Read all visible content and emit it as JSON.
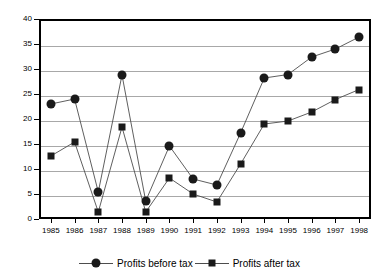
{
  "chart_data": {
    "type": "line",
    "title": "",
    "xlabel": "",
    "ylabel": "",
    "ylim": [
      0,
      40
    ],
    "ytick_step": 5,
    "yticks": [
      "0",
      "5",
      "10",
      "15",
      "20",
      "25",
      "30",
      "35",
      "40"
    ],
    "grid": true,
    "legend_position": "bottom",
    "categories": [
      "1985",
      "1986",
      "1987",
      "1988",
      "1989",
      "1990",
      "1991",
      "1992",
      "1993",
      "1994",
      "1995",
      "1996",
      "1997",
      "1998"
    ],
    "series": [
      {
        "name": "Profits before tax",
        "marker": "circle",
        "color": "#1a1a1a",
        "values": [
          23.0,
          24.0,
          5.4,
          28.8,
          3.6,
          14.6,
          8.0,
          6.8,
          17.2,
          28.2,
          28.9,
          32.4,
          34.0,
          36.4
        ]
      },
      {
        "name": "Profits after tax",
        "marker": "square",
        "color": "#1a1a1a",
        "values": [
          12.6,
          15.4,
          1.4,
          18.4,
          1.4,
          8.2,
          5.0,
          3.4,
          11.0,
          19.0,
          19.6,
          21.4,
          23.9,
          25.9
        ]
      }
    ]
  },
  "legend": {
    "entries": [
      {
        "label": "Profits before tax",
        "marker": "circle"
      },
      {
        "label": "Profits after tax",
        "marker": "square"
      }
    ]
  },
  "colors": {
    "axis": "#000000",
    "grid": "#a8a8a8",
    "series_line": "#4d4d4d",
    "marker": "#1a1a1a",
    "background": "#ffffff"
  }
}
